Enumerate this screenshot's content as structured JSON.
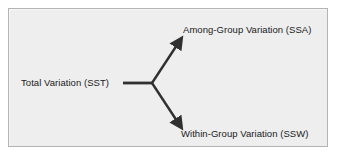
{
  "figure": {
    "type": "variation-decomposition-diagram",
    "panel": {
      "background_color": "#eeeeee",
      "border_color": "#b4b4b4"
    },
    "nodes": {
      "source": {
        "label": "Total Variation (SST)",
        "name": "total-variation-label"
      },
      "branch_upper": {
        "label": "Among-Group Variation (SSA)",
        "name": "among-group-variation-label"
      },
      "branch_lower": {
        "label": "Within-Group Variation (SSW)",
        "name": "within-group-variation-label"
      }
    },
    "connectors": {
      "stroke_color": "#303030",
      "trunk": {
        "name": "trunk-line",
        "from": [
          114,
          74
        ],
        "to": [
          143,
          74
        ]
      },
      "arrow_upper": {
        "name": "arrow-to-among-group",
        "from": [
          143,
          74
        ],
        "to": [
          172,
          30
        ],
        "arrowhead": "filled-triangle"
      },
      "arrow_lower": {
        "name": "arrow-to-within-group",
        "from": [
          143,
          74
        ],
        "to": [
          172,
          116
        ],
        "arrowhead": "filled-triangle"
      }
    }
  }
}
